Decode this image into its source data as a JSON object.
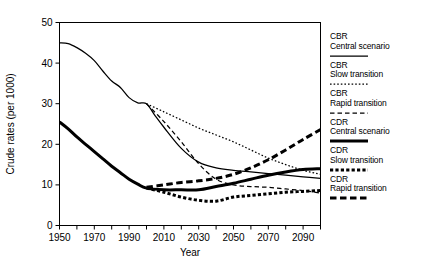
{
  "chart_data": {
    "type": "line",
    "title": "",
    "xlabel": "Year",
    "ylabel": "Crude rates (per 1000)",
    "xlim": [
      1950,
      2100
    ],
    "ylim": [
      0,
      50
    ],
    "yticks": [
      0,
      10,
      20,
      30,
      40,
      50
    ],
    "ytick_labels": [
      "0",
      "10",
      "20",
      "30",
      "40",
      "50"
    ],
    "xticks": [
      1950,
      1960,
      1970,
      1980,
      1990,
      2000,
      2010,
      2020,
      2030,
      2040,
      2050,
      2060,
      2070,
      2080,
      2090,
      2100
    ],
    "xtick_labels": [
      "1950",
      "",
      "1970",
      "",
      "1990",
      "",
      "2010",
      "",
      "2030",
      "",
      "2050",
      "",
      "2070",
      "",
      "2090",
      ""
    ],
    "grid": false,
    "legend_position": "right",
    "series": [
      {
        "name": "CBR Central scenario",
        "style": "solid",
        "width": "thin",
        "x": [
          1950,
          1955,
          1960,
          1965,
          1970,
          1975,
          1980,
          1985,
          1990,
          1995,
          2000,
          2005,
          2010,
          2020,
          2030,
          2040,
          2050,
          2060,
          2070,
          2080,
          2090,
          2100
        ],
        "y": [
          45.0,
          44.8,
          43.8,
          42.4,
          40.6,
          38.0,
          35.6,
          34.0,
          31.5,
          30.2,
          30.0,
          27.0,
          24.2,
          19.0,
          15.6,
          14.2,
          13.6,
          13.2,
          12.8,
          12.4,
          12.0,
          11.6
        ]
      },
      {
        "name": "CBR Slow transition",
        "style": "dotted",
        "width": "thin",
        "x": [
          2000,
          2010,
          2020,
          2030,
          2040,
          2050,
          2060,
          2070,
          2080,
          2090,
          2100
        ],
        "y": [
          30.0,
          28.0,
          26.0,
          24.0,
          22.3,
          20.6,
          18.6,
          16.6,
          15.0,
          13.6,
          12.6
        ]
      },
      {
        "name": "CBR Rapid transition",
        "style": "dashed",
        "width": "thin",
        "x": [
          2000,
          2010,
          2020,
          2030,
          2040,
          2050,
          2060,
          2070,
          2080,
          2090,
          2100
        ],
        "y": [
          30.0,
          25.6,
          20.6,
          15.2,
          11.4,
          10.0,
          9.6,
          9.4,
          9.0,
          8.6,
          8.0
        ]
      },
      {
        "name": "CDR Central scenario",
        "style": "solid",
        "width": "thick",
        "x": [
          1950,
          1955,
          1960,
          1965,
          1970,
          1975,
          1980,
          1985,
          1990,
          1995,
          2000,
          2010,
          2020,
          2030,
          2040,
          2050,
          2060,
          2070,
          2080,
          2090,
          2100
        ],
        "y": [
          25.5,
          23.8,
          21.8,
          20.0,
          18.2,
          16.4,
          14.6,
          13.0,
          11.4,
          10.2,
          9.2,
          8.8,
          8.8,
          8.8,
          9.6,
          10.4,
          11.4,
          12.4,
          13.2,
          13.8,
          14.0
        ]
      },
      {
        "name": "CDR Slow transition",
        "style": "dotted",
        "width": "thick",
        "x": [
          2000,
          2010,
          2020,
          2030,
          2040,
          2050,
          2060,
          2070,
          2080,
          2090,
          2100
        ],
        "y": [
          9.2,
          8.2,
          7.0,
          6.2,
          6.0,
          7.0,
          7.4,
          7.8,
          8.2,
          8.4,
          8.6
        ]
      },
      {
        "name": "CDR Rapid transition",
        "style": "dashed",
        "width": "thick",
        "x": [
          2000,
          2010,
          2020,
          2030,
          2040,
          2050,
          2060,
          2070,
          2080,
          2090,
          2100
        ],
        "y": [
          9.4,
          10.0,
          10.6,
          11.0,
          11.6,
          12.6,
          14.2,
          16.2,
          18.6,
          21.2,
          23.6
        ]
      }
    ]
  },
  "legend": {
    "entries": [
      {
        "title": "CBR",
        "subtitle": "Central scenario",
        "style": "solid",
        "width": "thin"
      },
      {
        "title": "CBR",
        "subtitle": "Slow transition",
        "style": "dotted",
        "width": "thin"
      },
      {
        "title": "CBR",
        "subtitle": "Rapid transition",
        "style": "dashed",
        "width": "thin"
      },
      {
        "title": "CDR",
        "subtitle": "Central scenario",
        "style": "solid",
        "width": "thick"
      },
      {
        "title": "CDR",
        "subtitle": "Slow transition",
        "style": "dotted",
        "width": "thick"
      },
      {
        "title": "CDR",
        "subtitle": "Rapid transition",
        "style": "dashed",
        "width": "thick"
      }
    ]
  },
  "colors": {
    "line": "#000000",
    "axis": "#000000",
    "background": "#ffffff"
  }
}
